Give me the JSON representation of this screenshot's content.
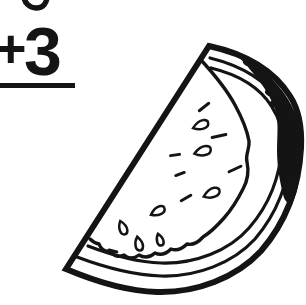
{
  "colors": {
    "ink": "#141414",
    "background": "#ffffff"
  },
  "math_problem": {
    "operator": "+",
    "addend": "3"
  },
  "illustration": {
    "subject": "watermelon-slice-line-art",
    "seeds": [
      {
        "type": "outlined",
        "x": 201,
        "y": 125,
        "rot": -18,
        "len": 17
      },
      {
        "type": "outlined",
        "x": 203,
        "y": 151,
        "rot": -14,
        "len": 18
      },
      {
        "type": "outlined",
        "x": 212,
        "y": 193,
        "rot": -20,
        "len": 18
      },
      {
        "type": "outlined",
        "x": 158,
        "y": 211,
        "rot": -25,
        "len": 16
      },
      {
        "type": "outlined",
        "x": 123,
        "y": 228,
        "rot": 72,
        "len": 15
      },
      {
        "type": "outlined",
        "x": 139,
        "y": 244,
        "rot": 80,
        "len": 15
      },
      {
        "type": "outlined",
        "x": 160,
        "y": 240,
        "rot": 75,
        "len": 13
      },
      {
        "type": "dash",
        "x": 204,
        "y": 107,
        "rot": -38,
        "len": 12
      },
      {
        "type": "dash",
        "x": 219,
        "y": 136,
        "rot": -12,
        "len": 14
      },
      {
        "type": "dash",
        "x": 175,
        "y": 155,
        "rot": -8,
        "len": 9
      },
      {
        "type": "dash",
        "x": 235,
        "y": 169,
        "rot": -25,
        "len": 13
      },
      {
        "type": "dash",
        "x": 180,
        "y": 174,
        "rot": -20,
        "len": 9
      },
      {
        "type": "dash",
        "x": 186,
        "y": 198,
        "rot": -30,
        "len": 11
      },
      {
        "type": "dash",
        "x": 113,
        "y": 251,
        "rot": 15,
        "len": 8
      }
    ],
    "rind_spots": [
      {
        "x": 246,
        "y": 63,
        "rot": 38
      },
      {
        "x": 256,
        "y": 72,
        "rot": 38
      },
      {
        "x": 264,
        "y": 82,
        "rot": 40
      },
      {
        "x": 268,
        "y": 93,
        "rot": 45
      },
      {
        "x": 273,
        "y": 104,
        "rot": 48
      }
    ]
  }
}
